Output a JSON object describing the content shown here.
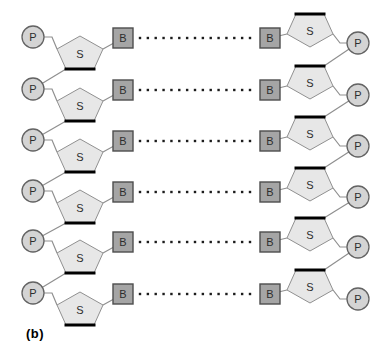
{
  "figure": {
    "label": "(b)"
  },
  "diagram": {
    "type": "dna-double-strand-schematic",
    "base_pairs": 6,
    "node_labels": {
      "phosphate": "P",
      "sugar": "S",
      "base": "B"
    },
    "hydrogen_bond": {
      "dots_per_row": 15,
      "x_start": 140,
      "x_end": 250,
      "dot_size": 2.4
    },
    "colors": {
      "background": "#ffffff",
      "phosphate_fill": "#d4d4d4",
      "phosphate_stroke": "#636363",
      "sugar_fill": "#e7e7e7",
      "sugar_stroke": "#909090",
      "sugar_thick_edge": "#000000",
      "base_fill": "#a5a5a5",
      "base_stroke": "#4d4d4d",
      "connector": "#8f8f8f",
      "dot": "#1c1c1c",
      "letter": "#2e2e2e",
      "figure_label": "#000000"
    }
  }
}
